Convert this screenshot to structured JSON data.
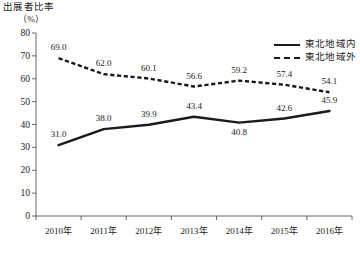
{
  "chart_data": {
    "type": "line",
    "title": "出展者比率",
    "unit_label": "（%）",
    "xlabel": "",
    "ylabel": "",
    "ylim": [
      0,
      80
    ],
    "ytick_step": 10,
    "yticks": [
      "0",
      "10",
      "20",
      "30",
      "40",
      "50",
      "60",
      "70",
      "80"
    ],
    "categories": [
      "2010年",
      "2011年",
      "2012年",
      "2013年",
      "2014年",
      "2015年",
      "2016年"
    ],
    "grid": false,
    "legend_position": "top-right",
    "series": [
      {
        "name": "東北地域内",
        "style": "solid",
        "color": "#1a1a1a",
        "values": [
          31.0,
          38.0,
          39.9,
          43.4,
          40.8,
          42.6,
          45.9
        ],
        "labels": [
          "31.0",
          "38.0",
          "39.9",
          "43.4",
          "40.8",
          "42.6",
          "45.9"
        ]
      },
      {
        "name": "東北地域外",
        "style": "dashed",
        "color": "#1a1a1a",
        "values": [
          69.0,
          62.0,
          60.1,
          56.6,
          59.2,
          57.4,
          54.1
        ],
        "labels": [
          "69.0",
          "62.0",
          "60.1",
          "56.6",
          "59.2",
          "57.4",
          "54.1"
        ]
      }
    ]
  },
  "legend": {
    "items": [
      {
        "label": "東北地域内"
      },
      {
        "label": "東北地域外"
      }
    ]
  }
}
